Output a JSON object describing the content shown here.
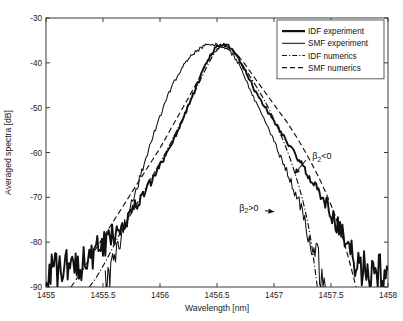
{
  "chart_data": {
    "type": "line",
    "title": "",
    "xlabel": "Wavelength [nm]",
    "ylabel": "Averaged spectra [dB]",
    "xlim": [
      1455,
      1458
    ],
    "ylim": [
      -90,
      -30
    ],
    "xticks": [
      1455,
      1455.5,
      1456,
      1456.5,
      1457,
      1457.5,
      1458
    ],
    "xticklabels": [
      "1455",
      "1455.5",
      "1456",
      "1456.5",
      "1457",
      "1457.5",
      "1458"
    ],
    "yticks": [
      -90,
      -80,
      -70,
      -60,
      -50,
      -40,
      -30
    ],
    "yticklabels": [
      "-90",
      "-80",
      "-70",
      "-60",
      "-50",
      "-40",
      "-30"
    ],
    "grid": false,
    "legend_position": "top-right",
    "legend_entries": [
      {
        "label": "IDF experiment",
        "style": "solid-thick"
      },
      {
        "label": "SMF experiment",
        "style": "solid-thin"
      },
      {
        "label": "IDF numerics",
        "style": "dash-dot"
      },
      {
        "label": "SMF numerics",
        "style": "dashed"
      }
    ],
    "annotations": [
      {
        "text": "β",
        "sub": "2",
        "rel": "<0",
        "full": "β₂<0",
        "x": 1457.42,
        "y": -61.5,
        "arrow_to_x": 1457.18,
        "arrow_to_y": -64.8
      },
      {
        "text": "β",
        "sub": "2",
        "rel": ">0",
        "full": "β₂>0",
        "x": 1456.78,
        "y": -73.0,
        "arrow_to_x": 1457.0,
        "arrow_to_y": -73.2
      }
    ],
    "series": [
      {
        "name": "IDF experiment",
        "style": "solid-thick",
        "note": "broad noisy experimental spectrum, noise floor near -88 dB at edges",
        "x": [
          1455.0,
          1455.05,
          1455.1,
          1455.15,
          1455.2,
          1455.25,
          1455.3,
          1455.35,
          1455.4,
          1455.45,
          1455.5,
          1455.55,
          1455.6,
          1455.65,
          1455.7,
          1455.75,
          1455.8,
          1455.85,
          1455.9,
          1455.95,
          1456.0,
          1456.05,
          1456.1,
          1456.15,
          1456.2,
          1456.25,
          1456.3,
          1456.35,
          1456.4,
          1456.45,
          1456.5,
          1456.55,
          1456.6,
          1456.65,
          1456.7,
          1456.75,
          1456.8,
          1456.85,
          1456.9,
          1456.95,
          1457.0,
          1457.05,
          1457.1,
          1457.15,
          1457.2,
          1457.25,
          1457.3,
          1457.35,
          1457.4,
          1457.45,
          1457.5,
          1457.55,
          1457.6,
          1457.65,
          1457.7,
          1457.75,
          1457.8,
          1457.85,
          1457.9,
          1457.95,
          1458.0
        ],
        "y": [
          -87.0,
          -85.5,
          -87.5,
          -84.5,
          -86.5,
          -84.0,
          -85.0,
          -83.0,
          -84.0,
          -82.0,
          -81.0,
          -79.5,
          -78.0,
          -76.5,
          -75.0,
          -73.0,
          -71.5,
          -69.5,
          -67.5,
          -65.5,
          -63.0,
          -60.5,
          -58.0,
          -55.5,
          -52.5,
          -49.5,
          -46.5,
          -43.5,
          -40.5,
          -38.0,
          -36.3,
          -35.9,
          -36.4,
          -37.6,
          -39.5,
          -42.0,
          -44.5,
          -47.0,
          -49.0,
          -51.0,
          -53.0,
          -55.0,
          -57.0,
          -59.0,
          -61.0,
          -63.0,
          -65.0,
          -67.0,
          -69.0,
          -71.0,
          -73.5,
          -76.0,
          -78.5,
          -81.5,
          -84.0,
          -86.0,
          -85.0,
          -87.0,
          -85.5,
          -87.5,
          -86.0
        ]
      },
      {
        "name": "SMF experiment",
        "style": "solid-thin",
        "note": "narrower experimental spectrum, drops to noise floor near 1455.55 and 1457.45",
        "x": [
          1455.52,
          1455.56,
          1455.6,
          1455.65,
          1455.7,
          1455.75,
          1455.8,
          1455.85,
          1455.9,
          1455.95,
          1456.0,
          1456.05,
          1456.1,
          1456.15,
          1456.2,
          1456.25,
          1456.3,
          1456.35,
          1456.4,
          1456.45,
          1456.5,
          1456.55,
          1456.6,
          1456.65,
          1456.7,
          1456.75,
          1456.8,
          1456.85,
          1456.9,
          1456.95,
          1457.0,
          1457.05,
          1457.1,
          1457.15,
          1457.2,
          1457.25,
          1457.3,
          1457.35,
          1457.4,
          1457.45
        ],
        "y": [
          -90.0,
          -87.0,
          -83.5,
          -79.5,
          -75.5,
          -71.5,
          -67.5,
          -63.5,
          -59.5,
          -55.5,
          -52.0,
          -48.5,
          -45.5,
          -43.0,
          -41.0,
          -39.2,
          -37.8,
          -36.8,
          -36.2,
          -36.0,
          -36.1,
          -36.5,
          -37.2,
          -38.5,
          -40.5,
          -43.5,
          -46.5,
          -49.5,
          -52.0,
          -54.5,
          -57.5,
          -60.5,
          -63.5,
          -66.5,
          -70.0,
          -73.5,
          -77.5,
          -81.5,
          -86.0,
          -90.0
        ]
      },
      {
        "name": "IDF numerics",
        "style": "dash-dot",
        "note": "dash-dot simulation; matches IDF on left, follows SMF-like slope on right lower tail",
        "x": [
          1455.38,
          1455.45,
          1455.55,
          1455.65,
          1455.75,
          1455.85,
          1455.95,
          1456.05,
          1456.15,
          1456.25,
          1456.35,
          1456.45,
          1456.5,
          1456.55,
          1456.65,
          1456.75,
          1456.85,
          1456.95,
          1457.05,
          1457.15,
          1457.25,
          1457.32,
          1457.38
        ],
        "y": [
          -90.0,
          -87.5,
          -83.0,
          -78.0,
          -73.5,
          -69.0,
          -64.5,
          -60.0,
          -55.0,
          -49.5,
          -44.0,
          -39.0,
          -37.2,
          -36.6,
          -37.8,
          -41.5,
          -45.5,
          -50.0,
          -55.5,
          -62.0,
          -70.5,
          -79.0,
          -90.0
        ]
      },
      {
        "name": "SMF numerics",
        "style": "dashed",
        "note": "dashed simulation; overlays IDF experiment envelope, extends to right edge",
        "x": [
          1455.22,
          1455.3,
          1455.4,
          1455.5,
          1455.6,
          1455.7,
          1455.8,
          1455.9,
          1456.0,
          1456.1,
          1456.2,
          1456.3,
          1456.4,
          1456.48,
          1456.55,
          1456.62,
          1456.72,
          1456.82,
          1456.92,
          1457.02,
          1457.12,
          1457.22,
          1457.32,
          1457.42,
          1457.52,
          1457.62,
          1457.72
        ],
        "y": [
          -90.0,
          -87.0,
          -83.0,
          -79.0,
          -75.0,
          -71.0,
          -67.0,
          -63.0,
          -59.0,
          -54.5,
          -50.0,
          -45.5,
          -40.5,
          -37.4,
          -36.3,
          -36.9,
          -39.5,
          -43.0,
          -46.5,
          -50.0,
          -53.5,
          -57.5,
          -62.0,
          -67.0,
          -73.0,
          -80.5,
          -90.0
        ]
      }
    ]
  }
}
